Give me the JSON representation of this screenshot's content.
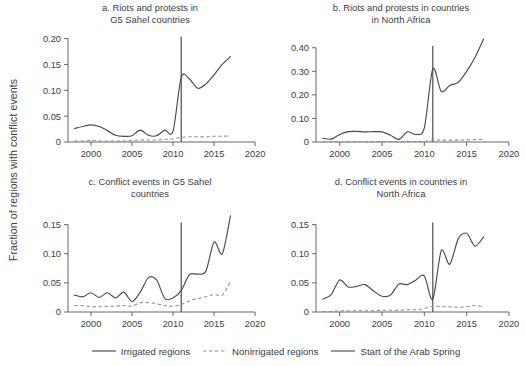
{
  "figure": {
    "ylabel": "Fraction of regions with conflict events",
    "x_ticks": [
      "2000",
      "2005",
      "2010",
      "2015",
      "2020"
    ],
    "x_tick_values": [
      2000,
      2005,
      2010,
      2015,
      2020
    ],
    "xlim": [
      1997.2,
      2020.6
    ],
    "event_year": 2011,
    "colors": {
      "irrigated": "#4a4a52",
      "nonirrigated": "#8d8d95",
      "event": "#55555d",
      "axis": "#55555d",
      "text": "#3d3d45",
      "background": "#ffffff"
    }
  },
  "legend": {
    "items": [
      {
        "label": "Irrigated regions",
        "style": "solid",
        "color": "#4a4a52",
        "name": "legend-irrigated"
      },
      {
        "label": "Nonirrigated regions",
        "style": "dashed",
        "color": "#8d8d95",
        "name": "legend-nonirrigated"
      },
      {
        "label": "Start of the Arab Spring",
        "style": "solid",
        "color": "#55555d",
        "name": "legend-arab-spring"
      }
    ]
  },
  "chart_data": [
    {
      "id": "panel-a",
      "type": "line",
      "title": "a. Riots and protests in\nG5 Sahel countries",
      "title_line1": "a. Riots and protests in",
      "title_line2": "G5 Sahel countries",
      "xlabel": "",
      "ylabel": "",
      "grid": false,
      "legend_position": "figure-bottom",
      "xlim": [
        1997.2,
        2020.6
      ],
      "ylim": [
        0,
        0.205
      ],
      "y_ticks": [
        0,
        0.05,
        0.1,
        0.15,
        0.2
      ],
      "y_tick_labels": [
        "0",
        "0.05",
        "0.10",
        "0.15",
        "0.20"
      ],
      "x_ticks": [
        2000,
        2005,
        2010,
        2015,
        2020
      ],
      "x_tick_labels": [
        "2000",
        "2005",
        "2010",
        "2015",
        "2020"
      ],
      "annotations": [
        {
          "type": "vline",
          "x": 2011,
          "label": "Start of the Arab Spring"
        }
      ],
      "x": [
        1998,
        1999,
        2000,
        2001,
        2002,
        2003,
        2004,
        2005,
        2006,
        2007,
        2008,
        2009,
        2010,
        2011,
        2012,
        2013,
        2014,
        2015,
        2016,
        2017
      ],
      "series": [
        {
          "name": "Irrigated regions",
          "style": "solid",
          "values": [
            0.026,
            0.03,
            0.033,
            0.03,
            0.022,
            0.013,
            0.011,
            0.012,
            0.023,
            0.013,
            0.012,
            0.023,
            0.021,
            0.125,
            0.122,
            0.104,
            0.112,
            0.13,
            0.15,
            0.165
          ]
        },
        {
          "name": "Nonirrigated regions",
          "style": "dashed",
          "values": [
            0.002,
            0.002,
            0.003,
            0.002,
            0.002,
            0.002,
            0.002,
            0.003,
            0.004,
            0.004,
            0.004,
            0.005,
            0.006,
            0.009,
            0.01,
            0.01,
            0.01,
            0.011,
            0.011,
            0.012
          ]
        }
      ]
    },
    {
      "id": "panel-b",
      "type": "line",
      "title": "b. Riots and protests in countries\nin North Africa",
      "title_line1": "b. Riots and protests in countries",
      "title_line2": "in North Africa",
      "xlabel": "",
      "ylabel": "",
      "grid": false,
      "legend_position": "figure-bottom",
      "xlim": [
        1997.2,
        2020.6
      ],
      "ylim": [
        0,
        0.45
      ],
      "y_ticks": [
        0,
        0.1,
        0.2,
        0.3,
        0.4
      ],
      "y_tick_labels": [
        "0",
        "0.10",
        "0.20",
        "0.30",
        "0.40"
      ],
      "x_ticks": [
        2000,
        2005,
        2010,
        2015,
        2020
      ],
      "x_tick_labels": [
        "2000",
        "2005",
        "2010",
        "2015",
        "2020"
      ],
      "annotations": [
        {
          "type": "vline",
          "x": 2011,
          "label": "Start of the Arab Spring"
        }
      ],
      "x": [
        1998,
        1999,
        2000,
        2001,
        2002,
        2003,
        2004,
        2005,
        2006,
        2007,
        2008,
        2009,
        2010,
        2011,
        2012,
        2013,
        2014,
        2015,
        2016,
        2017
      ],
      "series": [
        {
          "name": "Irrigated regions",
          "style": "solid",
          "values": [
            0.016,
            0.012,
            0.032,
            0.044,
            0.045,
            0.043,
            0.044,
            0.043,
            0.029,
            0.011,
            0.043,
            0.032,
            0.06,
            0.31,
            0.215,
            0.24,
            0.253,
            0.3,
            0.36,
            0.437
          ]
        },
        {
          "name": "Nonirrigated regions",
          "style": "dashed",
          "values": [
            0.001,
            0.001,
            0.001,
            0.001,
            0.001,
            0.001,
            0.001,
            0.002,
            0.002,
            0.002,
            0.002,
            0.002,
            0.003,
            0.008,
            0.008,
            0.008,
            0.008,
            0.009,
            0.01,
            0.011
          ]
        }
      ]
    },
    {
      "id": "panel-c",
      "type": "line",
      "title": "c. Conflict events in G5 Sahel\ncountries",
      "title_line1": "c. Conflict events in G5 Sahel",
      "title_line2": "countries",
      "xlabel": "",
      "ylabel": "",
      "grid": false,
      "legend_position": "figure-bottom",
      "xlim": [
        1997.2,
        2020.6
      ],
      "ylim": [
        0,
        0.175
      ],
      "y_ticks": [
        0,
        0.05,
        0.1,
        0.15
      ],
      "y_tick_labels": [
        "0",
        "0.05",
        "0.10",
        "0.15"
      ],
      "x_ticks": [
        2000,
        2005,
        2010,
        2015,
        2020
      ],
      "x_tick_labels": [
        "2000",
        "2005",
        "2010",
        "2015",
        "2020"
      ],
      "annotations": [
        {
          "type": "vline",
          "x": 2011,
          "label": "Start of the Arab Spring"
        }
      ],
      "x": [
        1998,
        1999,
        2000,
        2001,
        2002,
        2003,
        2004,
        2005,
        2006,
        2007,
        2008,
        2009,
        2010,
        2011,
        2012,
        2013,
        2014,
        2015,
        2016,
        2017
      ],
      "series": [
        {
          "name": "Irrigated regions",
          "style": "solid",
          "values": [
            0.029,
            0.026,
            0.033,
            0.025,
            0.033,
            0.024,
            0.034,
            0.018,
            0.034,
            0.059,
            0.055,
            0.023,
            0.024,
            0.037,
            0.064,
            0.065,
            0.07,
            0.12,
            0.1,
            0.165
          ]
        },
        {
          "name": "Nonirrigated regions",
          "style": "dashed",
          "values": [
            0.011,
            0.011,
            0.009,
            0.009,
            0.01,
            0.01,
            0.011,
            0.01,
            0.016,
            0.016,
            0.014,
            0.011,
            0.01,
            0.013,
            0.019,
            0.023,
            0.026,
            0.03,
            0.029,
            0.052
          ]
        }
      ]
    },
    {
      "id": "panel-d",
      "type": "line",
      "title": "d. Conflict events in countries in\nNorth Africa",
      "title_line1": "d. Conflict events in countries in",
      "title_line2": "North Africa",
      "xlabel": "",
      "ylabel": "",
      "grid": false,
      "legend_position": "figure-bottom",
      "xlim": [
        1997.2,
        2020.6
      ],
      "ylim": [
        0,
        0.175
      ],
      "y_ticks": [
        0,
        0.05,
        0.1,
        0.15
      ],
      "y_tick_labels": [
        "0",
        "0.05",
        "0.10",
        "0.15"
      ],
      "x_ticks": [
        2000,
        2005,
        2010,
        2015,
        2020
      ],
      "x_tick_labels": [
        "2000",
        "2005",
        "2010",
        "2015",
        "2020"
      ],
      "annotations": [
        {
          "type": "vline",
          "x": 2011,
          "label": "Start of the Arab Spring"
        }
      ],
      "x": [
        1998,
        1999,
        2000,
        2001,
        2002,
        2003,
        2004,
        2005,
        2006,
        2007,
        2008,
        2009,
        2010,
        2011,
        2012,
        2013,
        2014,
        2015,
        2016,
        2017
      ],
      "series": [
        {
          "name": "Irrigated regions",
          "style": "solid",
          "values": [
            0.022,
            0.03,
            0.055,
            0.043,
            0.044,
            0.047,
            0.036,
            0.027,
            0.029,
            0.048,
            0.047,
            0.055,
            0.062,
            0.022,
            0.105,
            0.082,
            0.125,
            0.135,
            0.113,
            0.129
          ]
        },
        {
          "name": "Nonirrigated regions",
          "style": "dashed",
          "values": [
            0.001,
            0.001,
            0.002,
            0.002,
            0.002,
            0.002,
            0.002,
            0.003,
            0.003,
            0.003,
            0.004,
            0.004,
            0.006,
            0.01,
            0.009,
            0.009,
            0.008,
            0.009,
            0.011,
            0.009
          ]
        }
      ]
    }
  ]
}
